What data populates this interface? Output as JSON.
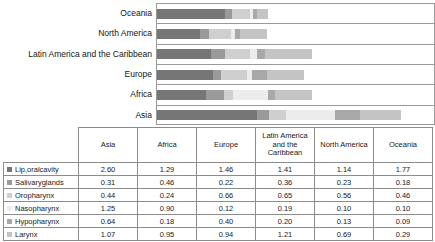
{
  "chart_data": {
    "type": "bar",
    "orientation": "horizontal",
    "stacked": true,
    "title": "",
    "xlabel": "",
    "ylabel": "",
    "grid": true,
    "legend_position": "table-row-labels",
    "axis_visible": true,
    "categories": [
      "Oceania",
      "North America",
      "Latin America and the Caribbean",
      "Europe",
      "Africa",
      "Asia"
    ],
    "table_categories": [
      "Asia",
      "Africa",
      "Europe",
      "Latin America and the Caribbean",
      "North America",
      "Oceania"
    ],
    "series": [
      {
        "name": "Lip,oralcavity",
        "color": "#767676",
        "values_by_table_category": [
          2.6,
          1.29,
          1.46,
          1.41,
          1.14,
          1.77
        ],
        "display": [
          "2.60",
          "1.29",
          "1.46",
          "1.41",
          "1.14",
          "1.77"
        ]
      },
      {
        "name": "Salivaryglands",
        "color": "#9a9a9a",
        "values_by_table_category": [
          0.31,
          0.46,
          0.22,
          0.36,
          0.23,
          0.18
        ],
        "display": [
          "0.31",
          "0.46",
          "0.22",
          "0.36",
          "0.23",
          "0.18"
        ]
      },
      {
        "name": "Oropharynx",
        "color": "#cfcfcf",
        "values_by_table_category": [
          0.44,
          0.24,
          0.66,
          0.65,
          0.56,
          0.46
        ],
        "display": [
          "0.44",
          "0.24",
          "0.66",
          "0.65",
          "0.56",
          "0.46"
        ]
      },
      {
        "name": "Nasopharynx",
        "color": "#ececec",
        "values_by_table_category": [
          1.25,
          0.9,
          0.12,
          0.19,
          0.1,
          0.1
        ],
        "display": [
          "1.25",
          "0.90",
          "0.12",
          "0.19",
          "0.10",
          "0.10"
        ]
      },
      {
        "name": "Hypopharynx",
        "color": "#a8a8a8",
        "values_by_table_category": [
          0.64,
          0.18,
          0.4,
          0.2,
          0.13,
          0.09
        ],
        "display": [
          "0.64",
          "0.18",
          "0.40",
          "0.20",
          "0.13",
          "0.09"
        ]
      },
      {
        "name": "Larynx",
        "color": "#c4c4c4",
        "values_by_table_category": [
          1.07,
          0.95,
          0.94,
          1.21,
          0.69,
          0.29
        ],
        "display": [
          "1.07",
          "0.95",
          "0.94",
          "1.21",
          "0.69",
          "0.29"
        ]
      }
    ],
    "stacks_top_to_bottom": [
      {
        "category": "Oceania",
        "segments": [
          1.77,
          0.18,
          0.46,
          0.1,
          0.09,
          0.29
        ],
        "total": 2.89
      },
      {
        "category": "North America",
        "segments": [
          1.14,
          0.23,
          0.56,
          0.1,
          0.13,
          0.69
        ],
        "total": 2.85
      },
      {
        "category": "Latin America and the Caribbean",
        "segments": [
          1.41,
          0.36,
          0.65,
          0.19,
          0.2,
          1.21
        ],
        "total": 4.02
      },
      {
        "category": "Europe",
        "segments": [
          1.46,
          0.22,
          0.66,
          0.12,
          0.4,
          0.94
        ],
        "total": 3.8
      },
      {
        "category": "Africa",
        "segments": [
          1.29,
          0.46,
          0.24,
          0.9,
          0.18,
          0.95
        ],
        "total": 4.02
      },
      {
        "category": "Asia",
        "segments": [
          2.6,
          0.31,
          0.44,
          1.25,
          0.64,
          1.07
        ],
        "total": 6.31
      }
    ],
    "xlim": [
      0,
      7.0
    ]
  },
  "table": {
    "corner_label": "",
    "column_headers": [
      "Asia",
      "Africa",
      "Europe",
      "Latin America and the Caribbean",
      "North America",
      "Oceania"
    ],
    "rows": [
      {
        "label": "Lip,oralcavity",
        "swatch": "#767676",
        "values": [
          "2.60",
          "1.29",
          "1.46",
          "1.41",
          "1.14",
          "1.77"
        ]
      },
      {
        "label": "Salivaryglands",
        "swatch": "#9a9a9a",
        "values": [
          "0.31",
          "0.46",
          "0.22",
          "0.36",
          "0.23",
          "0.18"
        ]
      },
      {
        "label": "Oropharynx",
        "swatch": "#cfcfcf",
        "values": [
          "0.44",
          "0.24",
          "0.66",
          "0.65",
          "0.56",
          "0.46"
        ]
      },
      {
        "label": "Nasopharynx",
        "swatch": "#ececec",
        "values": [
          "1.25",
          "0.90",
          "0.12",
          "0.19",
          "0.10",
          "0.10"
        ]
      },
      {
        "label": "Hypopharynx",
        "swatch": "#a8a8a8",
        "values": [
          "0.64",
          "0.18",
          "0.40",
          "0.20",
          "0.13",
          "0.09"
        ]
      },
      {
        "label": "Larynx",
        "swatch": "#c4c4c4",
        "values": [
          "1.07",
          "0.95",
          "0.94",
          "1.21",
          "0.69",
          "0.29"
        ]
      }
    ]
  },
  "colors": {
    "border": "#8c8c8c",
    "gridline": "#9a9a9a",
    "text": "#1a1a1a",
    "background": "#ffffff"
  }
}
